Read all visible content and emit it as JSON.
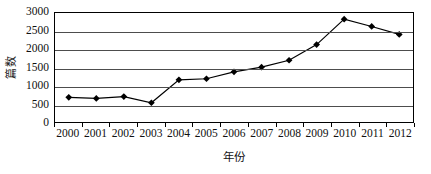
{
  "chart_data": {
    "type": "line",
    "title": "",
    "xlabel": "年份",
    "ylabel": "篇数",
    "categories": [
      "2000",
      "2001",
      "2002",
      "2003",
      "2004",
      "2005",
      "2006",
      "2007",
      "2008",
      "2009",
      "2010",
      "2011",
      "2012"
    ],
    "values": [
      680,
      650,
      700,
      530,
      1160,
      1190,
      1380,
      1510,
      1700,
      2130,
      2830,
      2630,
      2410
    ],
    "series": [
      {
        "name": "篇数",
        "values": [
          680,
          650,
          700,
          530,
          1160,
          1190,
          1380,
          1510,
          1700,
          2130,
          2830,
          2630,
          2410
        ]
      }
    ],
    "ylim": [
      0,
      3000
    ],
    "yticks": [
      "0",
      "500",
      "1000",
      "1500",
      "2000",
      "2500",
      "3000"
    ],
    "ytick_values": [
      0,
      500,
      1000,
      1500,
      2000,
      2500,
      3000
    ],
    "xticks": [
      "2000",
      "2001",
      "2002",
      "2003",
      "2004",
      "2005",
      "2006",
      "2007",
      "2008",
      "2009",
      "2010",
      "2011",
      "2012"
    ],
    "grid": true,
    "grid_axis": "y",
    "legend": false,
    "legend_position": "none",
    "marker": "diamond",
    "line_color": "#000000",
    "marker_color": "#000000",
    "background_color": "#ffffff"
  }
}
